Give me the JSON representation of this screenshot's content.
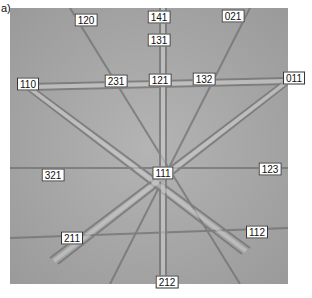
{
  "panel_label": "a)",
  "pattern": {
    "type": "Kikuchi / EBSD pattern",
    "background_color": "#a8a8a8",
    "poles": [
      {
        "label": "120",
        "x": 86,
        "y": 20
      },
      {
        "label": "141",
        "x": 159,
        "y": 17
      },
      {
        "label": "021",
        "x": 233,
        "y": 16
      },
      {
        "label": "131",
        "x": 159,
        "y": 40
      },
      {
        "label": "110",
        "x": 28,
        "y": 84
      },
      {
        "label": "231",
        "x": 116,
        "y": 81
      },
      {
        "label": "121",
        "x": 160,
        "y": 80
      },
      {
        "label": "132",
        "x": 204,
        "y": 79
      },
      {
        "label": "011",
        "x": 294,
        "y": 78
      },
      {
        "label": "321",
        "x": 53,
        "y": 175
      },
      {
        "label": "111",
        "x": 163,
        "y": 173
      },
      {
        "label": "123",
        "x": 270,
        "y": 169
      },
      {
        "label": "211",
        "x": 72,
        "y": 238
      },
      {
        "label": "112",
        "x": 257,
        "y": 232
      },
      {
        "label": "212",
        "x": 167,
        "y": 282
      }
    ]
  }
}
